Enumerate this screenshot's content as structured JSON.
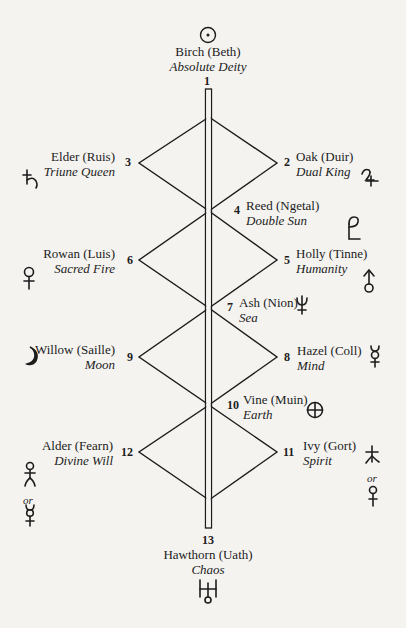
{
  "diagram": {
    "type": "ogham-tree-calendar-zigzag",
    "pillar": {
      "top_label": "1",
      "bottom_label": "13"
    },
    "colors": {
      "ink": "#1c1c1c",
      "paper": "#f4f3f0"
    }
  },
  "nodes": [
    {
      "number": "1",
      "name": "Birch (Beth)",
      "meaning": "Absolute Deity",
      "position": "top",
      "symbol": "sun-icon"
    },
    {
      "number": "2",
      "name": "Oak (Duir)",
      "meaning": "Dual King",
      "position": "right",
      "symbol": "jupiter-icon"
    },
    {
      "number": "3",
      "name": "Elder (Ruis)",
      "meaning": "Triune Queen",
      "position": "left",
      "symbol": "saturn-icon"
    },
    {
      "number": "4",
      "name": "Reed (Ngetal)",
      "meaning": "Double Sun",
      "position": "center-right",
      "symbol": "pluto-icon"
    },
    {
      "number": "5",
      "name": "Holly (Tinne)",
      "meaning": "Humanity",
      "position": "right",
      "symbol": "mars-inverted-icon"
    },
    {
      "number": "6",
      "name": "Rowan (Luis)",
      "meaning": "Sacred Fire",
      "position": "left",
      "symbol": "venus-icon"
    },
    {
      "number": "7",
      "name": "Ash (Nion)",
      "meaning": "Sea",
      "position": "center-right",
      "symbol": "neptune-icon"
    },
    {
      "number": "8",
      "name": "Hazel (Coll)",
      "meaning": "Mind",
      "position": "right",
      "symbol": "mercury-icon"
    },
    {
      "number": "9",
      "name": "Willow (Saille)",
      "meaning": "Moon",
      "position": "left",
      "symbol": "moon-icon"
    },
    {
      "number": "10",
      "name": "Vine (Muin)",
      "meaning": "Earth",
      "position": "center-right",
      "symbol": "earth-icon"
    },
    {
      "number": "11",
      "name": "Ivy (Gort)",
      "meaning": "Spirit",
      "position": "right",
      "symbol": "ceres-or-venus-icon",
      "alt_connector": "or"
    },
    {
      "number": "12",
      "name": "Alder (Fearn)",
      "meaning": "Divine Will",
      "position": "left",
      "symbol": "juno-or-mercury-icon",
      "alt_connector": "or"
    },
    {
      "number": "13",
      "name": "Hawthorn (Uath)",
      "meaning": "Chaos",
      "position": "bottom",
      "symbol": "uranus-icon"
    }
  ],
  "labels": {
    "or": "or"
  }
}
